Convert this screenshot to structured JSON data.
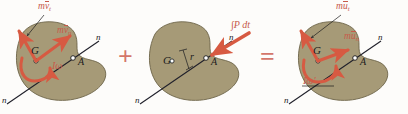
{
  "figure": {
    "body_fill": "#a69a77",
    "body_stroke": "#6d6448",
    "vector_color": "#d75a42",
    "label_red": "#c75a4a",
    "label_dark": "#1b1b1b",
    "operator_color": "#d4766a",
    "background": "#fdfcfa"
  },
  "operators": {
    "plus": "+",
    "equals": "="
  },
  "panel1": {
    "name": "momentum-before-impact",
    "labels": {
      "mv_t": {
        "prefix": "m",
        "over": "v",
        "sub": "t"
      },
      "mv_n": {
        "prefix": "m",
        "over": "v",
        "sub": "n"
      },
      "centroid": "G",
      "contact_point": "A",
      "spin": {
        "symbol": "I",
        "omega": "ω"
      },
      "axis_top": "n",
      "axis_bottom": "n"
    }
  },
  "panel2": {
    "name": "impulse-during-impact",
    "labels": {
      "impulse": "∫P dt",
      "centroid": "G",
      "contact_point": "A",
      "moment_arm": "r",
      "axis_top": "n",
      "axis_bottom": "n"
    }
  },
  "panel3": {
    "name": "momentum-after-impact",
    "labels": {
      "mu_t": {
        "prefix": "m",
        "over": "u",
        "sub": "t"
      },
      "mu_n": {
        "prefix": "m",
        "over": "u",
        "sub": "n"
      },
      "centroid": "G",
      "contact_point": "A",
      "spin": {
        "symbol": "I",
        "omega": "ω",
        "prime": "'"
      },
      "axis_top": "n",
      "axis_bottom": "n"
    }
  }
}
